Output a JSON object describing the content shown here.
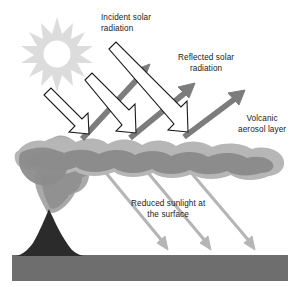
{
  "figure": {
    "background_color": "#ffffff"
  },
  "labels": {
    "incident": {
      "line1": "Incident solar",
      "line2": "radiation"
    },
    "reflected": {
      "line1": "Reflected solar",
      "line2": "radiation"
    },
    "aerosol": {
      "line1": "Volcanic",
      "line2": "aerosol layer"
    },
    "reduced": {
      "line1": "Reduced sunlight at",
      "line2": "the surface"
    }
  },
  "colors": {
    "sun": "#dcdcdc",
    "sun_core": "#ffffff",
    "incident_arrow_fill": "#ffffff",
    "incident_arrow_stroke": "#1a1a1a",
    "reflected_arrow": "#7a7a7a",
    "reduced_arrow": "#b8b8b8",
    "aerosol_light": "#b3b3b3",
    "aerosol_dark": "#8f8f8f",
    "plume": "#a8a8a8",
    "volcano": "#2b2b2b",
    "ground": "#6e6e6e",
    "text": "#1a1a1a"
  },
  "elements": {
    "sun": {
      "name": "sun",
      "points": 12,
      "cx": 57,
      "cy": 50,
      "outer_r": 31,
      "inner_r": 17,
      "core_r": 12
    },
    "incident_arrows": [
      {
        "id": 1,
        "from_x": 42,
        "from_y": 96,
        "to_x": 80,
        "to_y": 136
      },
      {
        "id": 2,
        "from_x": 82,
        "from_y": 82,
        "to_x": 127,
        "to_y": 134
      },
      {
        "id": 3,
        "from_x": 115,
        "from_y": 48,
        "to_x": 180,
        "to_y": 132
      }
    ],
    "reflected_arrows": [
      {
        "id": 1,
        "from_x": 84,
        "from_y": 136,
        "to_x": 148,
        "to_y": 66
      },
      {
        "id": 2,
        "from_x": 131,
        "from_y": 135,
        "to_x": 191,
        "to_y": 84
      },
      {
        "id": 3,
        "from_x": 185,
        "from_y": 134,
        "to_x": 240,
        "to_y": 92
      }
    ],
    "reduced_arrows": [
      {
        "id": 1,
        "from_x": 96,
        "from_y": 160,
        "to_x": 168,
        "to_y": 247
      },
      {
        "id": 2,
        "from_x": 137,
        "from_y": 160,
        "to_x": 211,
        "to_y": 247
      },
      {
        "id": 3,
        "from_x": 180,
        "from_y": 160,
        "to_x": 256,
        "to_y": 247
      }
    ],
    "volcano": {
      "apex_x": 49,
      "apex_y": 213,
      "base_left_x": 16,
      "base_right_x": 84,
      "base_y": 259
    },
    "ground": {
      "x": 12,
      "y": 255,
      "width": 276,
      "height": 26
    }
  }
}
